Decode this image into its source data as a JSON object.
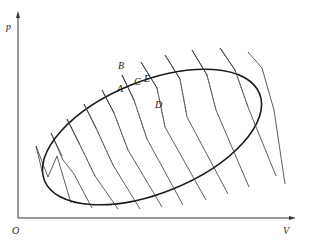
{
  "diagram": {
    "type": "p-V diagram with elliptical cycle approximated by zigzag adiabatic/isothermal segments",
    "axes": {
      "y_label": "p",
      "x_label": "V",
      "origin_label": "O"
    },
    "point_labels": {
      "A": "A",
      "B": "B",
      "C": "C",
      "D": "D",
      "E": "E"
    },
    "colors": {
      "line": "#333333",
      "ellipse": "#1a1a1a",
      "dashed": "#555555",
      "background": "#ffffff"
    }
  }
}
